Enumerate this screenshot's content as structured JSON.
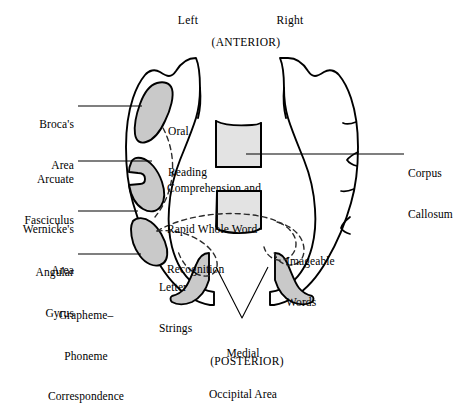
{
  "figure": {
    "orientation": {
      "hemisphere_left": "Left",
      "hemisphere_right": "Right",
      "anterior": "(ANTERIOR)",
      "posterior": "(POSTERIOR)"
    },
    "colors": {
      "outline": "#000000",
      "region_fill": "#c9c9c9",
      "callosum_fill": "#e3e3e3",
      "leader_line": "#000000",
      "background": "#ffffff",
      "dashed_path": "#3a3a3a"
    },
    "left_labels": [
      {
        "id": "brocas-area",
        "line1": "Broca's",
        "line2": "Area"
      },
      {
        "id": "arcuate-fasciculus",
        "line1": "Arcuate",
        "line2": "Fasciculus"
      },
      {
        "id": "wernickes-area",
        "line1": "Wernicke's",
        "line2": "Area"
      },
      {
        "id": "angular-gyrus",
        "line1": "Angular",
        "line2": "Gyrus"
      },
      {
        "id": "grapheme-phoneme",
        "line1": "Grapheme–",
        "line2": "Phoneme",
        "line3": "Correspondence"
      }
    ],
    "right_labels": [
      {
        "id": "corpus-callosum",
        "line1": "Corpus",
        "line2": "Callosum"
      }
    ],
    "interior_labels": [
      {
        "id": "oral-reading",
        "line1": "Oral",
        "line2": "Reading"
      },
      {
        "id": "comprehension",
        "line1": "Comprehension and",
        "line2": "Rapid Whole Word",
        "line3": "Recognition"
      },
      {
        "id": "letter-strings",
        "line1": "Letter",
        "line2": "Strings"
      },
      {
        "id": "imageable-words",
        "line1": "Imageable",
        "line2": "Words"
      }
    ],
    "bottom_labels": [
      {
        "id": "medial-occipital-area",
        "line1": "Medial",
        "line2": "Occipital Area"
      }
    ]
  }
}
